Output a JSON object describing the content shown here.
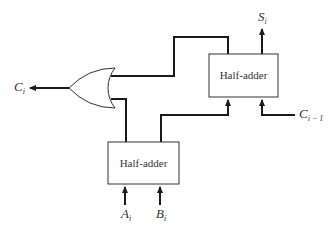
{
  "diagram": {
    "blocks": [
      {
        "id": "half-adder-1",
        "label": "Half-adder"
      },
      {
        "id": "half-adder-2",
        "label": "Half-adder"
      }
    ],
    "gates": [
      {
        "id": "or-gate",
        "type": "OR"
      }
    ],
    "signals": {
      "carry_out": {
        "base": "C",
        "sub": "i"
      },
      "sum": {
        "base": "S",
        "sub": "i"
      },
      "carry_in": {
        "base": "C",
        "sub": "i − 1"
      },
      "input_a": {
        "base": "A",
        "sub": "i"
      },
      "input_b": {
        "base": "B",
        "sub": "i"
      }
    },
    "colors": {
      "line": "#1a1a1a",
      "text": "#333333",
      "background": "#ffffff"
    }
  }
}
